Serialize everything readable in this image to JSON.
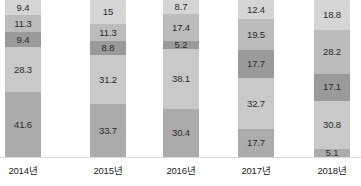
{
  "chart_data": {
    "type": "bar",
    "subtype": "stacked-bar-100",
    "title": "",
    "subtitle": "",
    "xlabel": "",
    "ylabel": "",
    "ylim": [
      0,
      100
    ],
    "grid": false,
    "legend": "none",
    "orientation": "vertical",
    "stack_order": "top-to-bottom",
    "categories": [
      "2014년",
      "2015년",
      "2016년",
      "2017년",
      "2018년"
    ],
    "series": [
      {
        "name": "구간1",
        "color": "#d5d5d5",
        "values": [
          9.4,
          15,
          8.7,
          12.4,
          18.8
        ]
      },
      {
        "name": "구간2",
        "color": "#bcbcbc",
        "values": [
          11.3,
          11.3,
          17.4,
          19.5,
          28.2
        ]
      },
      {
        "name": "구간3",
        "color": "#9a9a9a",
        "values": [
          9.4,
          8.8,
          5.2,
          17.7,
          17.1
        ]
      },
      {
        "name": "구간4",
        "color": "#c9c9c9",
        "values": [
          28.3,
          31.2,
          38.1,
          32.7,
          30.8
        ]
      },
      {
        "name": "구간5",
        "color": "#ababab",
        "values": [
          41.6,
          33.7,
          30.4,
          17.7,
          5.1
        ]
      }
    ],
    "bars": [
      {
        "category": "2014년",
        "segments": [
          {
            "label": "9.4",
            "value": 9.4,
            "color": "#d5d5d5"
          },
          {
            "label": "11.3",
            "value": 11.3,
            "color": "#bcbcbc"
          },
          {
            "label": "9.4",
            "value": 9.4,
            "color": "#9a9a9a"
          },
          {
            "label": "28.3",
            "value": 28.3,
            "color": "#c9c9c9"
          },
          {
            "label": "41.6",
            "value": 41.6,
            "color": "#ababab"
          }
        ]
      },
      {
        "category": "2015년",
        "segments": [
          {
            "label": "15",
            "value": 15,
            "color": "#d5d5d5"
          },
          {
            "label": "11.3",
            "value": 11.3,
            "color": "#bcbcbc"
          },
          {
            "label": "8.8",
            "value": 8.8,
            "color": "#9a9a9a"
          },
          {
            "label": "31.2",
            "value": 31.2,
            "color": "#c9c9c9"
          },
          {
            "label": "33.7",
            "value": 33.7,
            "color": "#ababab"
          }
        ]
      },
      {
        "category": "2016년",
        "segments": [
          {
            "label": "8.7",
            "value": 8.7,
            "color": "#d5d5d5"
          },
          {
            "label": "17.4",
            "value": 17.4,
            "color": "#bcbcbc"
          },
          {
            "label": "5.2",
            "value": 5.2,
            "color": "#9a9a9a"
          },
          {
            "label": "38.1",
            "value": 38.1,
            "color": "#c9c9c9"
          },
          {
            "label": "30.4",
            "value": 30.4,
            "color": "#ababab"
          }
        ]
      },
      {
        "category": "2017년",
        "segments": [
          {
            "label": "12.4",
            "value": 12.4,
            "color": "#d5d5d5"
          },
          {
            "label": "19.5",
            "value": 19.5,
            "color": "#bcbcbc"
          },
          {
            "label": "17.7",
            "value": 17.7,
            "color": "#9a9a9a"
          },
          {
            "label": "32.7",
            "value": 32.7,
            "color": "#c9c9c9"
          },
          {
            "label": "17.7",
            "value": 17.7,
            "color": "#ababab"
          }
        ]
      },
      {
        "category": "2018년",
        "segments": [
          {
            "label": "18.8",
            "value": 18.8,
            "color": "#d5d5d5"
          },
          {
            "label": "28.2",
            "value": 28.2,
            "color": "#bcbcbc"
          },
          {
            "label": "17.1",
            "value": 17.1,
            "color": "#9a9a9a"
          },
          {
            "label": "30.8",
            "value": 30.8,
            "color": "#c9c9c9"
          },
          {
            "label": "5.1",
            "value": 5.1,
            "color": "#ababab"
          }
        ]
      }
    ]
  },
  "layout": {
    "bar_x": [
      5,
      90,
      163,
      238,
      314
    ],
    "bar_width": 36,
    "plot_height": 157,
    "baseline_color": "#d8d8d8"
  }
}
